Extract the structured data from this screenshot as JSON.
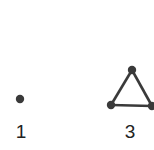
{
  "diagram": {
    "graphs": [
      {
        "label": "1",
        "nodes": [
          {
            "x": 20,
            "y": 99
          }
        ],
        "edges": []
      },
      {
        "label": "3",
        "nodes": [
          {
            "x": 132,
            "y": 70
          },
          {
            "x": 111,
            "y": 105
          },
          {
            "x": 152,
            "y": 106
          }
        ],
        "edges": [
          [
            0,
            1
          ],
          [
            1,
            2
          ],
          [
            2,
            0
          ]
        ]
      }
    ],
    "colors": {
      "node": "#3a3a3a",
      "edge": "#3a3a3a",
      "label": "#222222"
    }
  }
}
